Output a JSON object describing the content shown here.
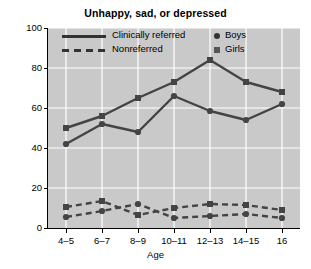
{
  "chart_data": {
    "type": "line",
    "title": "Unhappy, sad, or depressed",
    "xlabel": "Age",
    "ylabel": "Percentage",
    "categories": [
      "4–5",
      "6–7",
      "8–9",
      "10–11",
      "12–13",
      "14–15",
      "16"
    ],
    "ylim": [
      0,
      100
    ],
    "yticks": [
      0,
      20,
      40,
      60,
      80,
      100
    ],
    "grid": true,
    "legend_position": "upper-left-inside",
    "series": [
      {
        "name": "Clinically referred — Girls",
        "line_style": "solid",
        "marker": "square",
        "color": "#444444",
        "values": [
          50,
          56,
          65,
          73,
          84,
          73,
          68
        ]
      },
      {
        "name": "Clinically referred — Boys",
        "line_style": "solid",
        "marker": "circle",
        "color": "#444444",
        "values": [
          42,
          52,
          48,
          66,
          58.5,
          54,
          62
        ]
      },
      {
        "name": "Nonreferred — Girls",
        "line_style": "dashed",
        "marker": "square",
        "color": "#444444",
        "values": [
          10.5,
          13.5,
          6.5,
          10,
          12,
          11.5,
          9
        ]
      },
      {
        "name": "Nonreferred — Boys",
        "line_style": "dashed",
        "marker": "circle",
        "color": "#444444",
        "values": [
          5.5,
          8.5,
          12,
          5,
          6,
          7,
          5
        ]
      }
    ],
    "legend": {
      "line_entries": [
        {
          "label": "Clinically referred",
          "style": "solid"
        },
        {
          "label": "Nonreferred",
          "style": "dashed"
        }
      ],
      "marker_entries": [
        {
          "label": "Boys",
          "marker": "circle"
        },
        {
          "label": "Girls",
          "marker": "square"
        }
      ]
    }
  },
  "colors": {
    "plot_background": "#c9c9c9",
    "gridline": "#ffffff",
    "series": "#444444",
    "axis": "#000000",
    "figure_background": "#ffffff"
  }
}
